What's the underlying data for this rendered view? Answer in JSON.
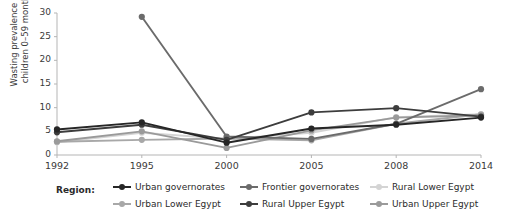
{
  "chart_data": {
    "type": "line",
    "title": "",
    "xlabel": "",
    "ylabel": "Wasting prevalence among\nchildren 0–59 months (%)",
    "categories": [
      "1992",
      "1995",
      "2000",
      "2005",
      "2008",
      "2014"
    ],
    "ylim": [
      0,
      30
    ],
    "yticks": [
      0,
      5,
      10,
      15,
      20,
      25,
      30
    ],
    "grid": false,
    "legend_position": "bottom",
    "legend_title": "Region:",
    "series": [
      {
        "name": "Urban governorates",
        "color": "#262626",
        "values": [
          5.4,
          6.9,
          2.6,
          5.6,
          6.4,
          7.9
        ]
      },
      {
        "name": "Frontier governorates",
        "color": "#6b6b6b",
        "values": [
          null,
          29.2,
          3.9,
          3.4,
          6.6,
          13.9
        ]
      },
      {
        "name": "Rural Lower Egypt",
        "color": "#d4d4d4",
        "values": [
          2.7,
          4.7,
          3.4,
          4.7,
          8.0,
          8.6
        ]
      },
      {
        "name": "Urban Lower Egypt",
        "color": "#a8a8a8",
        "values": [
          2.8,
          3.2,
          3.5,
          3.1,
          6.6,
          8.6
        ]
      },
      {
        "name": "Rural Upper Egypt",
        "color": "#3d3d3d",
        "values": [
          4.8,
          6.4,
          3.2,
          9.0,
          9.9,
          8.1
        ]
      },
      {
        "name": "Urban Upper Egypt",
        "color": "#9a9a9a",
        "values": [
          2.9,
          5.0,
          1.5,
          5.2,
          7.9,
          8.4
        ]
      }
    ]
  },
  "legend_layout": [
    {
      "series_index": 0,
      "left": 113,
      "top": 0
    },
    {
      "series_index": 1,
      "left": 240,
      "top": 0
    },
    {
      "series_index": 2,
      "left": 370,
      "top": 0
    },
    {
      "series_index": 3,
      "left": 113,
      "top": 17
    },
    {
      "series_index": 4,
      "left": 240,
      "top": 17
    },
    {
      "series_index": 5,
      "left": 370,
      "top": 17
    }
  ],
  "axis_colors": {
    "axis_line": "#b5b5b5",
    "tick_text": "#3a3a3a"
  }
}
